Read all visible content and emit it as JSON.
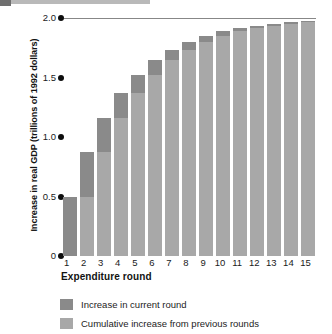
{
  "chart_data": {
    "type": "bar",
    "title": "",
    "subtitle": "",
    "xlabel": "Expenditure round",
    "ylabel": "Increase in real GDP (trillions of 1992 dollars)",
    "stacked": true,
    "grid": false,
    "legend_position": "bottom-left",
    "categories": [
      "1",
      "2",
      "3",
      "4",
      "5",
      "6",
      "7",
      "8",
      "9",
      "10",
      "11",
      "12",
      "13",
      "14",
      "15"
    ],
    "ylim": [
      0,
      2.0
    ],
    "ytick_labels": [
      "0",
      "0.5",
      "1.0",
      "1.5",
      "2.0"
    ],
    "ytick_values": [
      0,
      0.5,
      1.0,
      1.5,
      2.0
    ],
    "series": [
      {
        "name": "Cumulative increase from previous rounds",
        "color": "#a8a8a8",
        "values": [
          0,
          0.5,
          0.875,
          1.156,
          1.367,
          1.525,
          1.644,
          1.733,
          1.8,
          1.85,
          1.887,
          1.915,
          1.937,
          1.952,
          1.964
        ]
      },
      {
        "name": "Increase in current round",
        "color": "#8a8a8a",
        "values": [
          0.5,
          0.375,
          0.281,
          0.211,
          0.158,
          0.119,
          0.089,
          0.067,
          0.05,
          0.037,
          0.028,
          0.022,
          0.015,
          0.012,
          0.009
        ]
      }
    ],
    "totals": [
      0.5,
      0.875,
      1.156,
      1.367,
      1.525,
      1.644,
      1.733,
      1.8,
      1.85,
      1.887,
      1.915,
      1.937,
      1.952,
      1.964,
      1.973
    ],
    "annotations": [
      {
        "name": "multiplier-limit-line",
        "y": 2.0,
        "label": ""
      }
    ]
  },
  "legend": {
    "items": [
      {
        "label": "Increase in current round",
        "color": "#8a8a8a"
      },
      {
        "label": "Cumulative increase from previous rounds",
        "color": "#a8a8a8"
      }
    ]
  }
}
